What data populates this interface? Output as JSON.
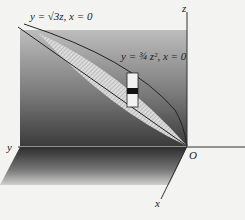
{
  "figure": {
    "labels": {
      "curve1": "y = √3z, x = 0",
      "curve2": "y = ¾ z², x = 0",
      "axis_z": "z",
      "axis_y": "y",
      "axis_x": "x",
      "origin": "O"
    },
    "colors": {
      "background": "#f3f3f1",
      "wall_top": "#b9b9b9",
      "wall_bottom": "#3a3a3a",
      "floor_dark": "#2e2e2e",
      "floor_light": "#c8c8c8",
      "region_fill": "#d9d9d9",
      "axis": "#333333",
      "strip_band": "#111111"
    },
    "elements": [
      "yz-plane",
      "xy-floor",
      "region-between-curves",
      "cross-section-strip"
    ]
  }
}
